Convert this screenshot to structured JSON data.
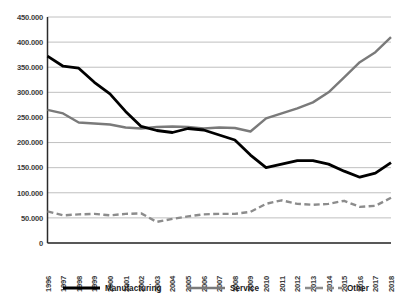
{
  "chart_data": {
    "type": "line",
    "title": "",
    "subtitle": "",
    "xlabel": "",
    "ylabel": "",
    "grid": "horizontal",
    "legend_position": "bottom",
    "ylim": [
      0,
      450000
    ],
    "ytick_values": [
      0,
      50000,
      100000,
      150000,
      200000,
      250000,
      300000,
      350000,
      400000,
      450000
    ],
    "ytick_labels": [
      "0",
      "50.000",
      "100.000",
      "150.000",
      "200.000",
      "250.000",
      "300.000",
      "350.000",
      "400.000",
      "450.000"
    ],
    "categories": [
      "1996",
      "1997",
      "1998",
      "1999",
      "2000",
      "2001",
      "2002",
      "2003",
      "2004",
      "2005",
      "2006",
      "2007",
      "2008",
      "2009",
      "2010",
      "2011",
      "2012",
      "2013",
      "2014",
      "2015",
      "2016",
      "2017",
      "2018"
    ],
    "series": [
      {
        "name": "Manufacturing",
        "color": "#000000",
        "style": "solid",
        "width": 2.8,
        "values": [
          372000,
          352000,
          348000,
          320000,
          297000,
          262000,
          232000,
          224000,
          220000,
          228000,
          225000,
          215000,
          205000,
          175000,
          150000,
          157000,
          164000,
          164000,
          157000,
          143000,
          131000,
          139000,
          160000
        ]
      },
      {
        "name": "Service",
        "color": "#7a7a7a",
        "style": "solid",
        "width": 2.4,
        "values": [
          265000,
          258000,
          240000,
          238000,
          236000,
          230000,
          228000,
          231000,
          232000,
          231000,
          228000,
          230000,
          229000,
          222000,
          248000,
          258000,
          268000,
          280000,
          300000,
          330000,
          360000,
          380000,
          410000
        ]
      },
      {
        "name": "Other",
        "color": "#8c8c8c",
        "style": "dashed",
        "width": 2.4,
        "values": [
          63000,
          55000,
          57000,
          58000,
          55000,
          58000,
          59000,
          42000,
          48000,
          53000,
          57000,
          58000,
          58000,
          62000,
          78000,
          85000,
          78000,
          76000,
          78000,
          84000,
          72000,
          74000,
          90000
        ]
      }
    ]
  },
  "legend": {
    "items": [
      {
        "label": "Manufacturing"
      },
      {
        "label": "Service"
      },
      {
        "label": "Other"
      }
    ]
  }
}
